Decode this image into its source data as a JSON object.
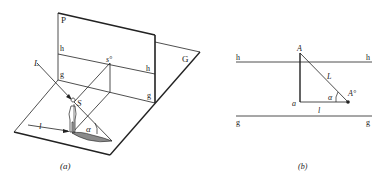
{
  "figure_a": {
    "caption": "(a)",
    "labels": {
      "plane_p": "P",
      "plane_g": "G",
      "h_left": "h",
      "h_right": "h",
      "g_left": "g",
      "g_right": "g",
      "sun_ray": "L",
      "sun_point": "s°",
      "shadow_length": "l",
      "object": "S",
      "angle": "α"
    }
  },
  "figure_b": {
    "caption": "(b)",
    "labels": {
      "h_left": "h",
      "h_right": "h",
      "g_left": "g",
      "g_right": "g",
      "point_top": "A",
      "point_base": "a",
      "point_shadow": "A°",
      "hypotenuse": "L",
      "base": "l",
      "angle": "α"
    }
  },
  "colors": {
    "line": "#222222",
    "shadow_fill": "#8a8a8a",
    "background": "#ffffff"
  }
}
